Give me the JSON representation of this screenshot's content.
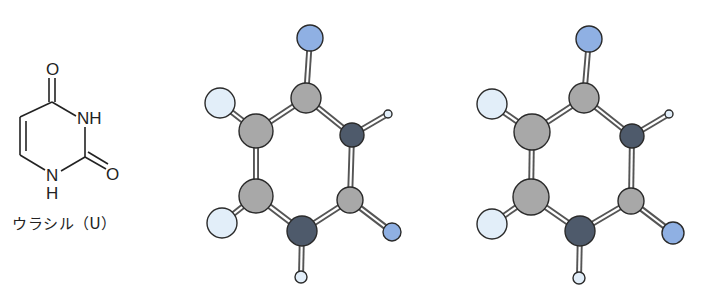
{
  "structural_formula": {
    "name": "uracil",
    "caption": "ウラシル（U）",
    "labels": {
      "o_top": "O",
      "nh_right": "NH",
      "o_right": "O",
      "n_bottom": "N",
      "h_bottom": "H"
    }
  },
  "colors": {
    "carbon": "#a8a8a8",
    "nitrogen": "#4e5a6b",
    "oxygen": "#8fb0e3",
    "hydrogen": "#e2eef9",
    "outline": "#2a2a2a",
    "bond": "#555555"
  },
  "ball_and_stick_models": [
    {
      "id": "left",
      "atoms": [
        {
          "el": "O",
          "x": 310,
          "y": 38,
          "r": 13
        },
        {
          "el": "C",
          "x": 306,
          "y": 98,
          "r": 15
        },
        {
          "el": "H",
          "x": 220,
          "y": 103,
          "r": 15
        },
        {
          "el": "C",
          "x": 256,
          "y": 131,
          "r": 17
        },
        {
          "el": "N",
          "x": 352,
          "y": 135,
          "r": 12
        },
        {
          "el": "Hs",
          "x": 388,
          "y": 114,
          "r": 4
        },
        {
          "el": "C",
          "x": 256,
          "y": 196,
          "r": 17
        },
        {
          "el": "H",
          "x": 222,
          "y": 223,
          "r": 15
        },
        {
          "el": "C",
          "x": 350,
          "y": 200,
          "r": 13
        },
        {
          "el": "O",
          "x": 392,
          "y": 232,
          "r": 9
        },
        {
          "el": "N",
          "x": 302,
          "y": 231,
          "r": 15
        },
        {
          "el": "Hs",
          "x": 301,
          "y": 277,
          "r": 6
        }
      ]
    },
    {
      "id": "right",
      "atoms": [
        {
          "el": "O",
          "x": 589,
          "y": 39,
          "r": 13
        },
        {
          "el": "C",
          "x": 584,
          "y": 98,
          "r": 15
        },
        {
          "el": "H",
          "x": 492,
          "y": 104,
          "r": 15
        },
        {
          "el": "C",
          "x": 532,
          "y": 132,
          "r": 18
        },
        {
          "el": "N",
          "x": 632,
          "y": 136,
          "r": 12
        },
        {
          "el": "Hs",
          "x": 669,
          "y": 114,
          "r": 4
        },
        {
          "el": "C",
          "x": 531,
          "y": 197,
          "r": 18
        },
        {
          "el": "H",
          "x": 492,
          "y": 224,
          "r": 15
        },
        {
          "el": "C",
          "x": 631,
          "y": 201,
          "r": 13
        },
        {
          "el": "O",
          "x": 673,
          "y": 233,
          "r": 11
        },
        {
          "el": "N",
          "x": 580,
          "y": 231,
          "r": 15
        },
        {
          "el": "Hs",
          "x": 579,
          "y": 278,
          "r": 6
        }
      ]
    }
  ],
  "bonds": [
    [
      0,
      1
    ],
    [
      1,
      3
    ],
    [
      1,
      4
    ],
    [
      4,
      5
    ],
    [
      3,
      2
    ],
    [
      3,
      6
    ],
    [
      6,
      7
    ],
    [
      6,
      10
    ],
    [
      10,
      11
    ],
    [
      10,
      8
    ],
    [
      8,
      4
    ],
    [
      8,
      9
    ]
  ]
}
